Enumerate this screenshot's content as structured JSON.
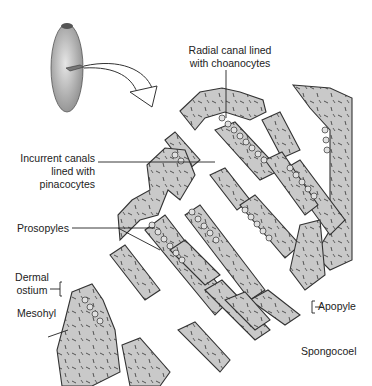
{
  "figure": {
    "colors": {
      "tissue_fill": "#c9c9c9",
      "outline": "#333333",
      "background": "#ffffff",
      "body_fill": "#bdbdbd"
    }
  },
  "labels": {
    "radial_canal": {
      "line1": "Radial canal lined",
      "line2": "with choanocytes"
    },
    "incurrent_canals": {
      "line1": "Incurrent canals",
      "line2": "lined with",
      "line3": "pinacocytes"
    },
    "prosopyles": "Prosopyles",
    "dermal_ostium": {
      "line1": "Dermal",
      "line2": "ostium"
    },
    "mesohyl": "Mesohyl",
    "apopyle": "Apopyle",
    "spongocoel": "Spongocoel"
  }
}
